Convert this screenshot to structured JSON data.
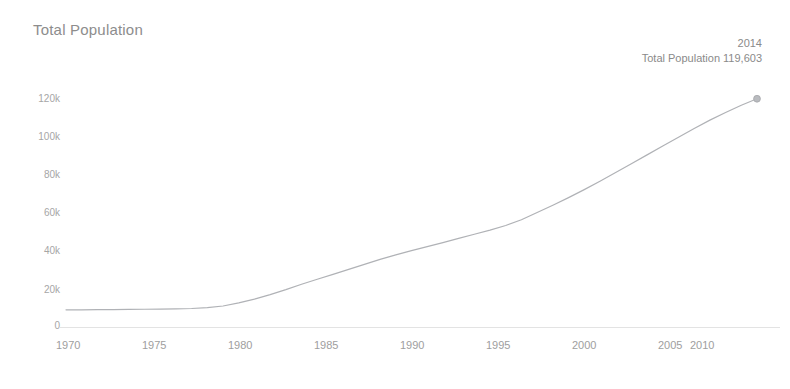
{
  "chart_title": "Total Population",
  "annotation": {
    "year": "2014",
    "value_label": "Total Population 119,603"
  },
  "axis": {
    "y_ticks": [
      "120k",
      "100k",
      "80k",
      "60k",
      "40k",
      "20k",
      "0"
    ],
    "x_ticks": [
      "1970",
      "1975",
      "1980",
      "1985",
      "1990",
      "1995",
      "2000",
      "2005",
      "2010"
    ]
  },
  "colors": {
    "line": "#b0b2b6",
    "marker": "#a8aaae",
    "title_text": "#8d8d8d",
    "tick_text": "#a6a6a6",
    "annotation_text": "#8a8a8a",
    "axis_line": "#e3e3e3",
    "background": "#ffffff"
  },
  "chart_data": {
    "type": "line",
    "title": "Total Population",
    "xlabel": "",
    "ylabel": "Total Population",
    "xlim": [
      1970,
      2014
    ],
    "ylim": [
      0,
      130000
    ],
    "grid": false,
    "legend": "none",
    "annotations": [
      {
        "x": 2014,
        "y": 119603,
        "text": "2014\nTotal Population 119,603",
        "marker": true
      }
    ],
    "x": [
      1970,
      1971,
      1972,
      1973,
      1974,
      1975,
      1976,
      1977,
      1978,
      1979,
      1980,
      1981,
      1982,
      1983,
      1984,
      1985,
      1986,
      1987,
      1988,
      1989,
      1990,
      1991,
      1992,
      1993,
      1994,
      1995,
      1996,
      1997,
      1998,
      1999,
      2000,
      2001,
      2002,
      2003,
      2004,
      2005,
      2006,
      2007,
      2008,
      2009,
      2010,
      2011,
      2012,
      2013,
      2014
    ],
    "series": [
      {
        "name": "Total Population",
        "values": [
          9000,
          9000,
          9100,
          9100,
          9200,
          9300,
          9400,
          9500,
          9700,
          10200,
          11000,
          12600,
          14600,
          17000,
          19600,
          22400,
          25000,
          27600,
          30200,
          32800,
          35400,
          37800,
          40000,
          42100,
          44200,
          46400,
          48600,
          50800,
          53200,
          56200,
          60000,
          63800,
          67800,
          72000,
          76400,
          81000,
          85600,
          90200,
          94800,
          99400,
          104000,
          108400,
          112400,
          116200,
          119603
        ]
      }
    ]
  },
  "layout": {
    "plot_left": 66,
    "plot_right": 757,
    "y_zero_px": 327,
    "y_120k_px": 98,
    "y_tick_px": [
      98,
      136,
      174,
      212,
      250,
      289,
      327
    ],
    "x_tick_px": [
      66,
      152,
      238,
      324,
      410,
      496,
      582,
      668,
      754
    ],
    "x_label_px": [
      57,
      143,
      229,
      315,
      401,
      487,
      573,
      659,
      690
    ]
  }
}
